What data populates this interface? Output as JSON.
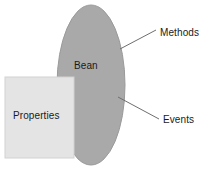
{
  "diagram": {
    "background_color": "#ffffff",
    "text_color": "#1a1a1a",
    "shapes": {
      "ellipse": {
        "label": "Bean",
        "fill": "#a9a9a9",
        "stroke": "#9a9a9a",
        "cx": 91,
        "cy": 85,
        "rx": 34,
        "ry": 80
      },
      "rectangle": {
        "label": "Properties",
        "fill": "#e4e4e4",
        "stroke": "#d2d2d2",
        "x": 5,
        "y": 77,
        "width": 69,
        "height": 81
      }
    },
    "callouts": [
      {
        "label": "Methods",
        "line_color": "#6e6e6e",
        "x1": 120,
        "y1": 49,
        "x2": 156,
        "y2": 30
      },
      {
        "label": "Events",
        "line_color": "#6e6e6e",
        "x1": 118,
        "y1": 97,
        "x2": 159,
        "y2": 119
      }
    ]
  }
}
